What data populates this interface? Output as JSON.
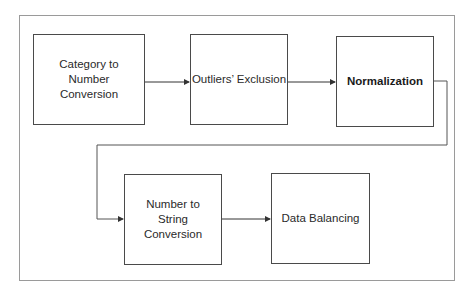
{
  "diagram": {
    "type": "flowchart",
    "steps": [
      {
        "id": "s1",
        "label": "Category to Number Conversion",
        "bold": false
      },
      {
        "id": "s2",
        "label": "Outliers’ Exclusion",
        "bold": false
      },
      {
        "id": "s3",
        "label": "Normalization",
        "bold": true
      },
      {
        "id": "s4",
        "label": "Number to String Conversion",
        "bold": false
      },
      {
        "id": "s5",
        "label": "Data Balancing",
        "bold": false
      }
    ],
    "edges": [
      {
        "from": "s1",
        "to": "s2"
      },
      {
        "from": "s2",
        "to": "s3"
      },
      {
        "from": "s3",
        "to": "s4"
      },
      {
        "from": "s4",
        "to": "s5"
      }
    ],
    "colors": {
      "box_border": "#4a4a4a",
      "frame_border": "#9a9a9a",
      "arrow": "#333333",
      "text": "#2a2a2a"
    }
  }
}
